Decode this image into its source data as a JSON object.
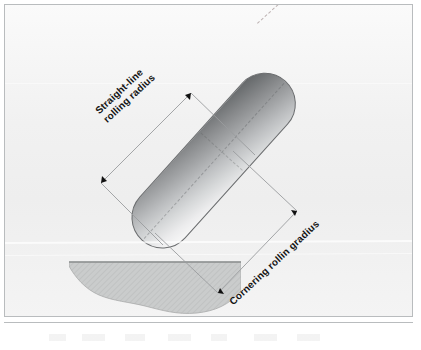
{
  "figure": {
    "kind": "technical-diagram",
    "page_background": "#f2f2f2",
    "frame_color": "#b9bcbe"
  },
  "tyre": {
    "name": "tyre-cross-section",
    "shape": "capsule",
    "tilt_degrees": 42,
    "gradient_dark": "#5f6163",
    "gradient_light": "#fcfcfc",
    "outline_color": "#6a6c6e",
    "seam_color": "#5a5c5e"
  },
  "ground": {
    "name": "road-surface",
    "fill": "#c9cbcb",
    "hatch_color": "#b4b6b6",
    "edge_color": "#8e9090"
  },
  "axis": {
    "name": "wheel-centre-axis",
    "style": "dashed",
    "color": "#8c7878"
  },
  "dimensions": [
    {
      "id": "straight-line",
      "label_lines": [
        "Straight-line",
        "rolling radius"
      ],
      "label_rotation_degrees": -43,
      "arrow_ends": "both",
      "line_color": "#9a9c9e",
      "arrow_color": "#101010"
    },
    {
      "id": "cornering",
      "label_lines": [
        "Cornering rollin gradius"
      ],
      "label_rotation_degrees": -43,
      "arrow_ends": "both",
      "line_color": "#9a9c9e",
      "arrow_color": "#101010"
    }
  ]
}
